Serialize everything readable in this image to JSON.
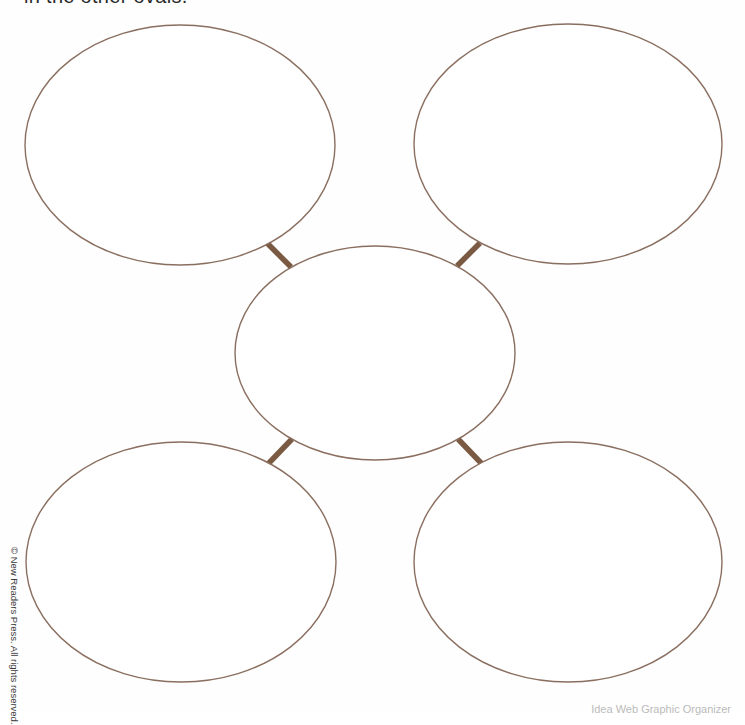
{
  "page": {
    "instruction_text": "in the other ovals.",
    "copyright_text": "© New Readers Press. All rights reserved.",
    "footer_text": "Idea Web Graphic Organizer"
  },
  "diagram": {
    "type": "idea-web",
    "oval_stroke_color": "#8a6f60",
    "connector_color": "#7a5a42",
    "ovals": [
      {
        "id": "top-left",
        "cx": 180,
        "cy": 145,
        "rx": 155,
        "ry": 120,
        "label": ""
      },
      {
        "id": "top-right",
        "cx": 568,
        "cy": 144,
        "rx": 154,
        "ry": 120,
        "label": ""
      },
      {
        "id": "center",
        "cx": 375,
        "cy": 353,
        "rx": 140,
        "ry": 107,
        "label": ""
      },
      {
        "id": "bottom-left",
        "cx": 181,
        "cy": 562,
        "rx": 155,
        "ry": 120,
        "label": ""
      },
      {
        "id": "bottom-right",
        "cx": 568,
        "cy": 562,
        "rx": 154,
        "ry": 120,
        "label": ""
      }
    ],
    "connectors": [
      {
        "id": "top-left",
        "x1": 267,
        "y1": 243,
        "x2": 291,
        "y2": 267
      },
      {
        "id": "top-right",
        "x1": 480,
        "y1": 243,
        "x2": 457,
        "y2": 266
      },
      {
        "id": "bottom-left",
        "x1": 292,
        "y1": 439,
        "x2": 268,
        "y2": 464
      },
      {
        "id": "bottom-right",
        "x1": 458,
        "y1": 439,
        "x2": 482,
        "y2": 464
      }
    ]
  }
}
